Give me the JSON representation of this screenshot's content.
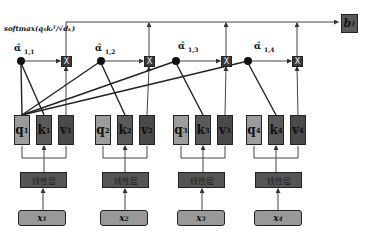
{
  "diagram": {
    "type": "self-attention schematic",
    "softmax_label": "softmax(q₁kᵢᵀ/√dₖ)",
    "output": {
      "label": "b",
      "sup": "1"
    },
    "alphas": [
      {
        "label": "α̂",
        "sub": "1,1"
      },
      {
        "label": "α̂",
        "sub": "1,2"
      },
      {
        "label": "α̂",
        "sub": "1,3"
      },
      {
        "label": "α̂",
        "sub": "1,4"
      }
    ],
    "multiply_symbol": "X",
    "groups": [
      {
        "q": "q",
        "k": "k",
        "v": "v",
        "idx": "1",
        "linear": "线性层",
        "input": "x"
      },
      {
        "q": "q",
        "k": "k",
        "v": "v",
        "idx": "2",
        "linear": "线性层",
        "input": "x"
      },
      {
        "q": "q",
        "k": "k",
        "v": "v",
        "idx": "3",
        "linear": "线性层",
        "input": "x"
      },
      {
        "q": "q",
        "k": "k",
        "v": "v",
        "idx": "4",
        "linear": "线性层",
        "input": "x"
      }
    ]
  },
  "colors": {
    "q_box": "#9c9c9c",
    "k_box": "#5a5a5a",
    "v_box": "#4a4a4a",
    "linear_box": "#555555",
    "input_box": "#999999",
    "output_box": "#595959",
    "line": "#333333"
  }
}
